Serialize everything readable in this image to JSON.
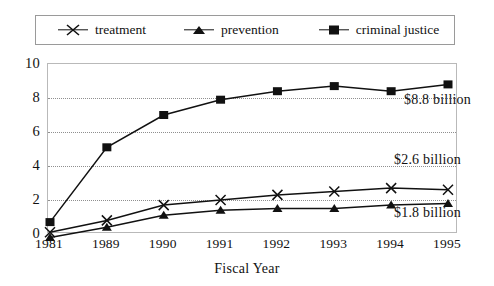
{
  "legend": {
    "entries": [
      {
        "label": "treatment",
        "marker": "x-marker",
        "color": "#111111"
      },
      {
        "label": "prevention",
        "marker": "triangle-marker",
        "color": "#111111"
      },
      {
        "label": "criminal justice",
        "marker": "square-marker",
        "color": "#111111"
      }
    ]
  },
  "axes": {
    "x_title": "Fiscal Year",
    "y_ticks": [
      "0",
      "2",
      "4",
      "6",
      "8",
      "10"
    ],
    "x_ticks": [
      "1981",
      "1989",
      "1990",
      "1991",
      "1992",
      "1993",
      "1994",
      "1995"
    ]
  },
  "annotations": [
    {
      "text": "$8.8 billion",
      "series": "criminal justice"
    },
    {
      "text": "$2.6 billion",
      "series": "treatment"
    },
    {
      "text": "$1.8 billion",
      "series": "prevention"
    }
  ],
  "chart_data": {
    "type": "line",
    "title": "",
    "subtitle": "",
    "xlabel": "Fiscal Year",
    "ylabel": "",
    "categories": [
      "1981",
      "1989",
      "1990",
      "1991",
      "1992",
      "1993",
      "1994",
      "1995"
    ],
    "ylim": [
      0,
      10
    ],
    "yticks": [
      0,
      2,
      4,
      6,
      8,
      10
    ],
    "grid": "horizontal-dotted",
    "legend_position": "top",
    "series": [
      {
        "name": "treatment",
        "marker": "x",
        "values": [
          0.1,
          0.8,
          1.7,
          2.0,
          2.3,
          2.5,
          2.7,
          2.6
        ],
        "end_label": "$2.6 billion"
      },
      {
        "name": "prevention",
        "marker": "triangle",
        "values": [
          -0.2,
          0.4,
          1.1,
          1.4,
          1.5,
          1.5,
          1.7,
          1.8
        ],
        "end_label": "$1.8 billion"
      },
      {
        "name": "criminal justice",
        "marker": "square",
        "values": [
          0.7,
          5.1,
          7.0,
          7.9,
          8.4,
          8.7,
          8.4,
          8.8
        ],
        "end_label": "$8.8 billion"
      }
    ]
  }
}
